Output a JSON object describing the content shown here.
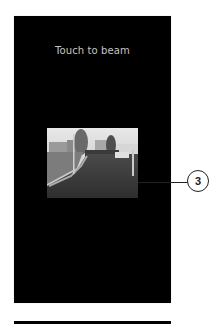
{
  "screen": {
    "prompt_text": "Touch to beam",
    "background_color": "#000000",
    "text_color": "#c4c4c4"
  },
  "photo": {
    "description": "grayscale street scene with houses, lamp post and road"
  },
  "callout": {
    "number": "3"
  }
}
